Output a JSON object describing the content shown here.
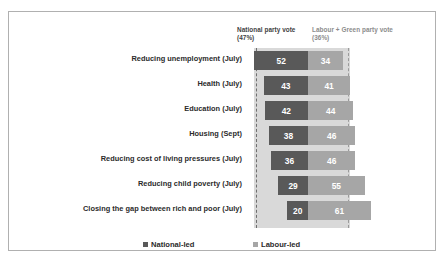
{
  "chart_data": {
    "type": "bar",
    "subtype": "stacked-horizontal-centered",
    "title": "",
    "xlabel": "",
    "ylabel": "",
    "categories": [
      "Reducing unemployment (July)",
      "Health (July)",
      "Education (July)",
      "Housing (Sept)",
      "Reducing cost of living pressures (July)",
      "Reducing child poverty (July)",
      "Closing the gap between rich and poor (July)"
    ],
    "series": [
      {
        "name": "National-led",
        "color": "#595959",
        "values": [
          52,
          43,
          42,
          38,
          36,
          29,
          20
        ]
      },
      {
        "name": "Labour-led",
        "color": "#a6a6a6",
        "values": [
          34,
          41,
          44,
          46,
          46,
          55,
          61
        ]
      }
    ],
    "reference_lines": [
      {
        "label": "National party vote",
        "value_label": "(47%)",
        "value": 47
      },
      {
        "label": "Labour + Green party vote",
        "value_label": "(36%)",
        "value": 36
      }
    ],
    "grid": false,
    "legend_position": "bottom"
  },
  "annotations": {
    "national_header_line1": "National party vote",
    "national_header_line2": "(47%)",
    "labour_header_line1": "Labour + Green party vote",
    "labour_header_line2": "(36%)"
  },
  "legend": {
    "items": [
      {
        "label": "National-led",
        "color": "#595959"
      },
      {
        "label": "Labour-led",
        "color": "#a6a6a6"
      }
    ]
  },
  "colors": {
    "national": "#595959",
    "labour": "#a6a6a6",
    "band": "#d9d9d9",
    "border": "#b0b0b0",
    "background": "#ffffff"
  }
}
